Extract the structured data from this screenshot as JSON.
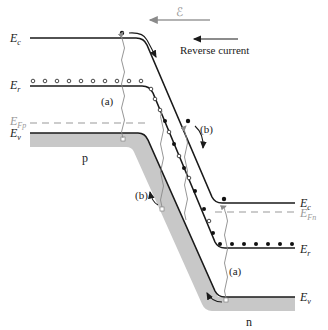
{
  "figure": {
    "field_label": "ℰ",
    "reverse_current_label": "Reverse current",
    "region_p_label": "p",
    "region_n_label": "n",
    "process_labels": {
      "a_left": "(a)",
      "b_upper": "(b)",
      "b_lower": "(b)",
      "a_right": "(a)"
    },
    "left_labels": {
      "Ec": {
        "main": "E",
        "sub": "c"
      },
      "Er": {
        "main": "E",
        "sub": "r"
      },
      "EFp": {
        "main": "E",
        "sub": "Fp"
      },
      "Ev": {
        "main": "E",
        "sub": "v"
      }
    },
    "right_labels": {
      "Ec": {
        "main": "E",
        "sub": "c"
      },
      "EFn": {
        "main": "E",
        "sub": "Fn"
      },
      "Er": {
        "main": "E",
        "sub": "r"
      },
      "Ev": {
        "main": "E",
        "sub": "v"
      }
    },
    "colors": {
      "band_line": "#1a1a1a",
      "valence_fill": "#c8c8c8",
      "fermi_dashed": "#9a9a9a",
      "field_arrow": "#9a9a9a",
      "wavy_arrow": "#8a8a8a"
    }
  }
}
